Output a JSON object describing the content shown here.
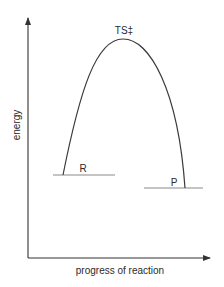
{
  "diagram": {
    "type": "reaction-energy-profile",
    "y_axis_label": "energy",
    "x_axis_label": "progress of reaction",
    "peak_label": "TS‡",
    "reactant_label": "R",
    "product_label": "P",
    "colors": {
      "axis": "#333333",
      "curve": "#3a3a3a",
      "level_lines": "#8a8a8a",
      "text": "#2a2a2a"
    }
  }
}
